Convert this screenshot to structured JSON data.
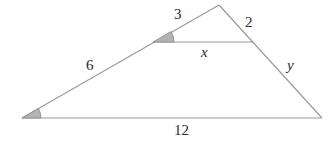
{
  "diagram": {
    "title": "",
    "labels": {
      "upper_left_side": "3",
      "upper_right_side": "2",
      "lower_left_side": "6",
      "lower_right_side": "y",
      "inner_segment": "x",
      "base": "12"
    },
    "colors": {
      "line": "#9a9a9a",
      "angle_fill": "#b3b3b3",
      "text": "#2a2a2a"
    }
  }
}
